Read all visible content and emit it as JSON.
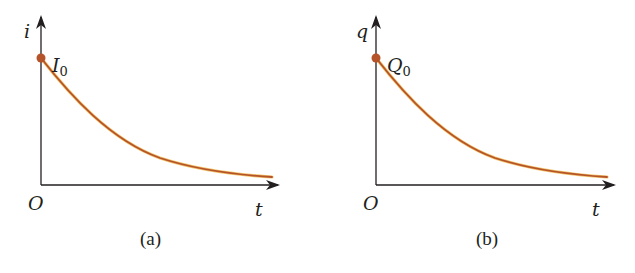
{
  "figure": {
    "panels": [
      {
        "id": "a",
        "caption": "(a)",
        "y_axis_label": "i",
        "x_axis_label": "t",
        "origin_label": "O",
        "initial_value_label": "I",
        "initial_value_subscript": "0",
        "curve": "exponential decay"
      },
      {
        "id": "b",
        "caption": "(b)",
        "y_axis_label": "q",
        "x_axis_label": "t",
        "origin_label": "O",
        "initial_value_label": "Q",
        "initial_value_subscript": "0",
        "curve": "exponential decay"
      }
    ],
    "colors": {
      "axis": "#231f20",
      "curve": "#b5532a",
      "curve_glow": "#f2c46a",
      "dot": "#b5532a"
    }
  }
}
